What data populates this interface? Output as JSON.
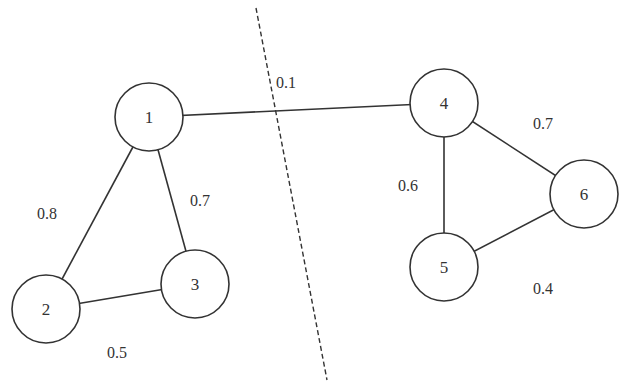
{
  "diagram": {
    "type": "weighted-graph-cut",
    "colors": {
      "stroke": "#333333",
      "background": "#ffffff"
    },
    "nodes": [
      {
        "id": "1",
        "label": "1",
        "x": 149,
        "y": 117,
        "r": 34
      },
      {
        "id": "2",
        "label": "2",
        "x": 46,
        "y": 309,
        "r": 34
      },
      {
        "id": "3",
        "label": "3",
        "x": 195,
        "y": 284,
        "r": 34
      },
      {
        "id": "4",
        "label": "4",
        "x": 444,
        "y": 103,
        "r": 34
      },
      {
        "id": "5",
        "label": "5",
        "x": 444,
        "y": 267,
        "r": 34
      },
      {
        "id": "6",
        "label": "6",
        "x": 584,
        "y": 194,
        "r": 34
      }
    ],
    "edges": [
      {
        "from": "1",
        "to": "2",
        "weight": "0.8",
        "label_x": 37,
        "label_y": 219
      },
      {
        "from": "1",
        "to": "3",
        "weight": "0.7",
        "label_x": 190,
        "label_y": 206
      },
      {
        "from": "2",
        "to": "3",
        "weight": "0.5",
        "label_x": 107,
        "label_y": 358
      },
      {
        "from": "1",
        "to": "4",
        "weight": "0.1",
        "label_x": 276,
        "label_y": 88
      },
      {
        "from": "4",
        "to": "5",
        "weight": "0.6",
        "label_x": 398,
        "label_y": 191
      },
      {
        "from": "4",
        "to": "6",
        "weight": "0.7",
        "label_x": 533,
        "label_y": 129
      },
      {
        "from": "5",
        "to": "6",
        "weight": "0.4",
        "label_x": 533,
        "label_y": 294
      }
    ],
    "cut_line": {
      "x1": 256,
      "y1": 8,
      "x2": 327,
      "y2": 380,
      "style": "dashed"
    }
  }
}
